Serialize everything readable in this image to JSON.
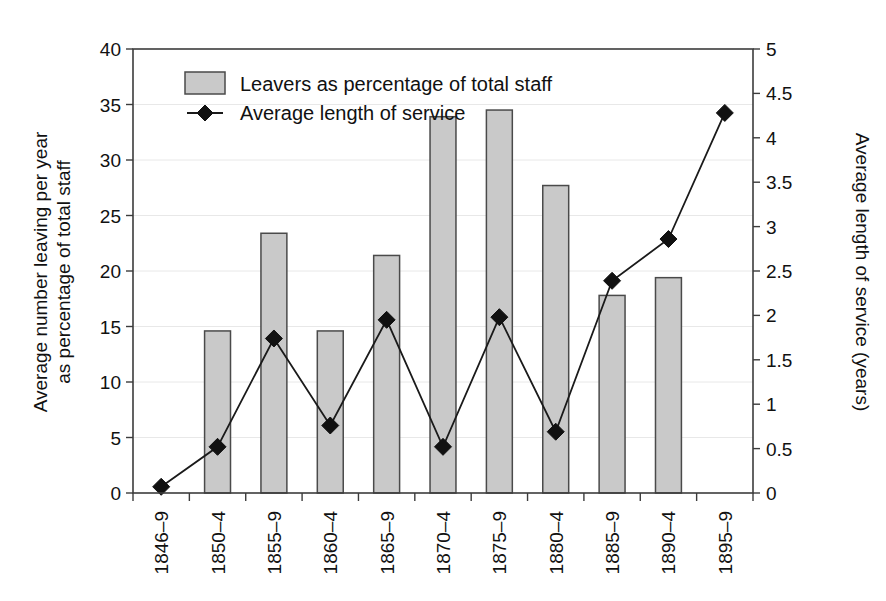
{
  "chart_data": {
    "type": "bar",
    "title": "",
    "subtitle": "",
    "xlabel": "",
    "ylabel": "Average number leaving per year as percentage of total staff",
    "y2label": "Average length of service (years)",
    "categories": [
      "1846–9",
      "1850–4",
      "1855–9",
      "1860–4",
      "1865–9",
      "1870–4",
      "1875–9",
      "1880–4",
      "1885–9",
      "1890–4",
      "1895–9"
    ],
    "ylim": [
      0,
      40
    ],
    "y2lim": [
      0,
      5
    ],
    "yticks": [
      0,
      5,
      10,
      15,
      20,
      25,
      30,
      35,
      40
    ],
    "ytick_labels": [
      "0",
      "5",
      "10",
      "15",
      "20",
      "25",
      "30",
      "35",
      "40"
    ],
    "y2ticks": [
      0,
      0.5,
      1,
      1.5,
      2,
      2.5,
      3,
      3.5,
      4,
      4.5,
      5
    ],
    "y2tick_labels": [
      "0",
      "0.5",
      "1",
      "1.5",
      "2",
      "2.5",
      "3",
      "3.5",
      "4",
      "4.5",
      "5"
    ],
    "grid": true,
    "legend_position": "top-left",
    "series": [
      {
        "name": "Leavers as percentage of total staff",
        "type": "bar",
        "axis": "left",
        "color": "#c9c9c9",
        "edge_color": "#4a4a4a",
        "values": [
          null,
          14.6,
          23.4,
          14.6,
          21.4,
          33.9,
          34.5,
          27.7,
          17.8,
          19.4,
          null
        ]
      },
      {
        "name": "Average length of service",
        "type": "line",
        "axis": "right",
        "color": "#111111",
        "marker": "diamond",
        "values": [
          0.07,
          0.52,
          1.74,
          0.76,
          1.95,
          0.52,
          1.98,
          0.69,
          2.39,
          2.86,
          4.28
        ]
      }
    ]
  },
  "axes": {
    "left": {
      "title_line1": "Average number leaving per year",
      "title_line2": "as percentage of total staff"
    },
    "right": {
      "title": "Average length of service (years)"
    }
  },
  "legend": {
    "items": [
      {
        "label": "Leavers as percentage of total staff",
        "marker": "swatch"
      },
      {
        "label": "Average length of service",
        "marker": "line-diamond"
      }
    ]
  },
  "colors": {
    "bar_fill": "#c9c9c9",
    "bar_edge": "#4a4a4a",
    "line": "#111111",
    "frame": "#3c3c3c",
    "grid": "#e8e8e8",
    "background": "#ffffff"
  }
}
